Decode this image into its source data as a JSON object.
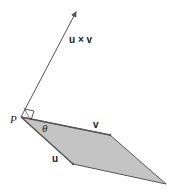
{
  "diagram": {
    "labels": {
      "cross_product": "u × v",
      "v": "v",
      "u": "u",
      "theta": "θ",
      "point": "P"
    },
    "colors": {
      "fill": "#c4c4c4",
      "stroke": "#555555",
      "label": "#222222"
    }
  }
}
